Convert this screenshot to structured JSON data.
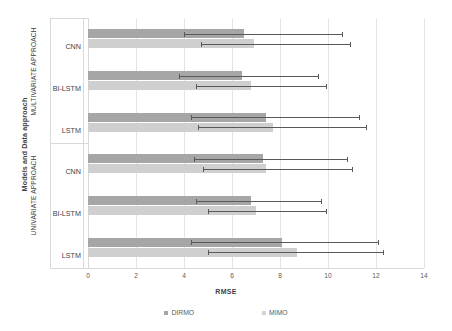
{
  "chart_data": {
    "type": "bar",
    "orientation": "horizontal",
    "title": "",
    "xlabel": "RMSE",
    "ylabel": "Models and Data approach",
    "xlim": [
      0,
      14
    ],
    "xticks": [
      0,
      2,
      4,
      6,
      8,
      10,
      12,
      14
    ],
    "grid": true,
    "legend_position": "bottom",
    "groups": [
      {
        "name": "MULTIVARIATE APPROACH",
        "categories": [
          "CNN",
          "BI-LSTM",
          "LSTM"
        ]
      },
      {
        "name": "UNIVARIATE APPROACH",
        "categories": [
          "CNN",
          "BI-LSTM",
          "LSTM"
        ]
      }
    ],
    "categories": [
      "CNN",
      "BI-LSTM",
      "LSTM",
      "CNN",
      "BI-LSTM",
      "LSTM"
    ],
    "series": [
      {
        "name": "DIRMO",
        "color": "#a6a6a6",
        "values": [
          6.5,
          6.4,
          7.4,
          7.3,
          6.8,
          8.1
        ],
        "error_low": [
          4.0,
          3.8,
          4.3,
          4.4,
          4.5,
          4.3
        ],
        "error_high": [
          10.6,
          9.6,
          11.3,
          10.8,
          9.7,
          12.1
        ]
      },
      {
        "name": "MIMO",
        "color": "#cfcfcf",
        "values": [
          6.9,
          6.8,
          7.7,
          7.4,
          7.0,
          8.7
        ],
        "error_low": [
          4.7,
          4.5,
          4.6,
          4.8,
          5.0,
          5.0
        ],
        "error_high": [
          10.9,
          9.9,
          11.6,
          11.0,
          9.9,
          12.3
        ]
      }
    ]
  },
  "legend": {
    "entries": [
      {
        "label": "DIRMO"
      },
      {
        "label": "MIMO"
      }
    ]
  },
  "axis": {
    "x_title": "RMSE",
    "y_title": "Models and Data approach"
  }
}
